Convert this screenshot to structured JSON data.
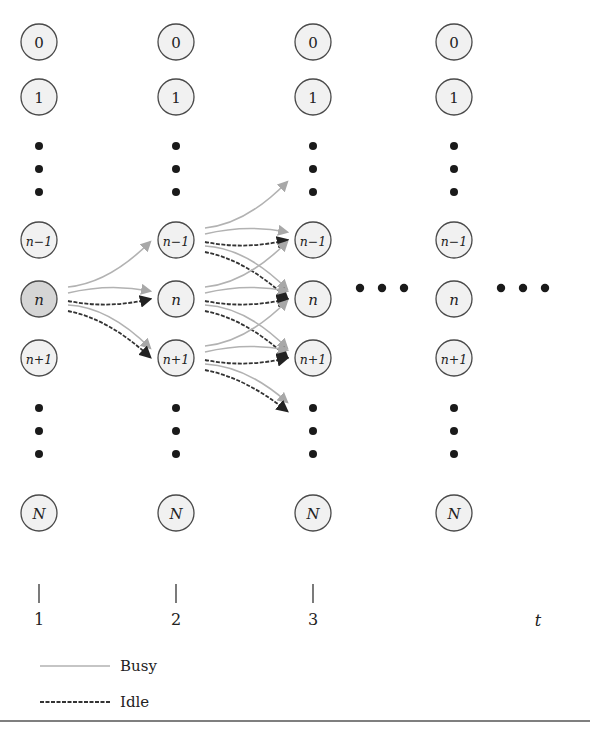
{
  "diagram": {
    "type": "state-transition-lattice",
    "columns": [
      {
        "time": "1",
        "states": [
          "0",
          "1",
          "n−1",
          "n",
          "n+1",
          "N"
        ],
        "highlighted_state": "n"
      },
      {
        "time": "2",
        "states": [
          "0",
          "1",
          "n−1",
          "n",
          "n+1",
          "N"
        ]
      },
      {
        "time": "3",
        "states": [
          "0",
          "1",
          "n−1",
          "n",
          "n+1",
          "N"
        ]
      },
      {
        "time": "",
        "states": [
          "0",
          "1",
          "n−1",
          "n",
          "n+1",
          "N"
        ]
      }
    ],
    "transitions": [
      {
        "from_col": 0,
        "from": "n",
        "to": "n−1",
        "kind": "busy"
      },
      {
        "from_col": 0,
        "from": "n",
        "to": "n",
        "kind": "busy"
      },
      {
        "from_col": 0,
        "from": "n",
        "to": "n",
        "kind": "idle"
      },
      {
        "from_col": 0,
        "from": "n",
        "to": "n+1",
        "kind": "busy"
      },
      {
        "from_col": 0,
        "from": "n",
        "to": "n+1",
        "kind": "idle"
      },
      {
        "from_col": 1,
        "from": "n−1",
        "to": "n−2",
        "kind": "busy"
      },
      {
        "from_col": 1,
        "from": "n−1",
        "to": "n−1",
        "kind": "busy"
      },
      {
        "from_col": 1,
        "from": "n−1",
        "to": "n−1",
        "kind": "idle"
      },
      {
        "from_col": 1,
        "from": "n−1",
        "to": "n",
        "kind": "busy"
      },
      {
        "from_col": 1,
        "from": "n−1",
        "to": "n",
        "kind": "idle"
      },
      {
        "from_col": 1,
        "from": "n",
        "to": "n−1",
        "kind": "busy"
      },
      {
        "from_col": 1,
        "from": "n",
        "to": "n",
        "kind": "busy"
      },
      {
        "from_col": 1,
        "from": "n",
        "to": "n",
        "kind": "idle"
      },
      {
        "from_col": 1,
        "from": "n",
        "to": "n+1",
        "kind": "busy"
      },
      {
        "from_col": 1,
        "from": "n",
        "to": "n+1",
        "kind": "idle"
      },
      {
        "from_col": 1,
        "from": "n+1",
        "to": "n",
        "kind": "busy"
      },
      {
        "from_col": 1,
        "from": "n+1",
        "to": "n+1",
        "kind": "busy"
      },
      {
        "from_col": 1,
        "from": "n+1",
        "to": "n+1",
        "kind": "idle"
      },
      {
        "from_col": 1,
        "from": "n+1",
        "to": "n+2",
        "kind": "busy"
      },
      {
        "from_col": 1,
        "from": "n+1",
        "to": "n+2",
        "kind": "idle"
      }
    ],
    "ellipsis_after_columns": [
      2,
      3
    ],
    "axis": {
      "ticks": [
        "1",
        "2",
        "3"
      ],
      "label": "t"
    },
    "legend": [
      {
        "kind": "busy",
        "label": "Busy",
        "color": "#b2b2b2",
        "style": "solid"
      },
      {
        "kind": "idle",
        "label": "Idle",
        "color": "#333333",
        "style": "dashed"
      }
    ]
  }
}
